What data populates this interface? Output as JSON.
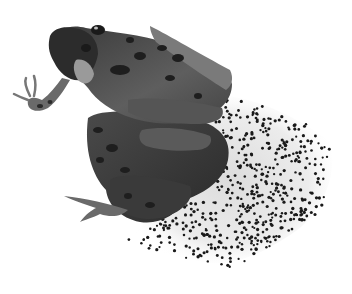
{
  "image": {
    "subject": "two frogs in amplexus with frogspawn",
    "alt": "Grayscale photo of a mating pair of frogs beside a cluster of eggs on a white background",
    "background": "#ffffff",
    "palette": {
      "frog_dark": "#2e2e2e",
      "frog_mid": "#5a5a5a",
      "frog_light": "#8a8a8a",
      "spot": "#1e1e1e",
      "egg_jelly": "#e6e6e6",
      "egg_dot": "#1a1a1a"
    }
  }
}
